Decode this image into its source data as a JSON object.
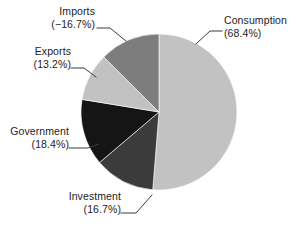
{
  "chart_data": {
    "type": "pie",
    "title": "",
    "subtitle": "",
    "xlabel": "",
    "ylabel": "",
    "legend_position": "none",
    "grid": false,
    "start_angle_deg": 0,
    "direction": "clockwise",
    "note": "Slice wedge sizes are proportional to the absolute value of each component; Imports is a negative contribution shown as a wedge of equal magnitude.",
    "total_absolute_percent": 133.4,
    "categories": [
      "Consumption",
      "Investment",
      "Government",
      "Exports",
      "Imports"
    ],
    "values": [
      68.4,
      16.7,
      18.4,
      13.2,
      -16.7
    ],
    "labels": [
      "(68.4%)",
      "(16.7%)",
      "(18.4%)",
      "(13.2%)",
      "(−16.7%)"
    ],
    "colors": [
      "#c2c2c2",
      "#3b3b3b",
      "#151515",
      "#c2c2c2",
      "#7d7d7d"
    ],
    "slices": [
      {
        "name": "Consumption",
        "label_line1": "Consumption",
        "label_line2": "(68.4%)",
        "value": 68.4,
        "color": "#c2c2c2",
        "wedge_degrees": 184.6,
        "start_deg": 0,
        "end_deg": 184.6
      },
      {
        "name": "Investment",
        "label_line1": "Investment",
        "label_line2": "(16.7%)",
        "value": 16.7,
        "color": "#3b3b3b",
        "wedge_degrees": 45.1,
        "start_deg": 184.6,
        "end_deg": 229.7
      },
      {
        "name": "Government",
        "label_line1": "Government",
        "label_line2": "(18.4%)",
        "value": 18.4,
        "color": "#151515",
        "wedge_degrees": 49.6,
        "start_deg": 229.7,
        "end_deg": 279.3
      },
      {
        "name": "Exports",
        "label_line1": "Exports",
        "label_line2": "(13.2%)",
        "value": 13.2,
        "color": "#c2c2c2",
        "wedge_degrees": 35.6,
        "start_deg": 279.3,
        "end_deg": 314.9
      },
      {
        "name": "Imports",
        "label_line1": "Imports",
        "label_line2": "(−16.7%)",
        "value": -16.7,
        "color": "#7d7d7d",
        "wedge_degrees": 45.1,
        "start_deg": 314.9,
        "end_deg": 360
      }
    ],
    "geometry": {
      "center_x": 159,
      "center_y": 112,
      "radius": 78
    },
    "background_color": "#ffffff",
    "label_color": "#1d1d1d",
    "leader_line_color": "#3b3b3b"
  }
}
